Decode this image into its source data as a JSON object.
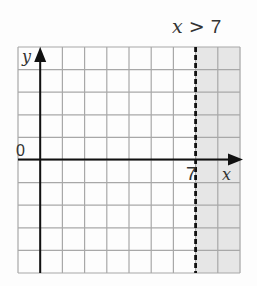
{
  "title": "x > 7",
  "axes": {
    "x_label": "x",
    "y_label": "y",
    "origin_label": "0",
    "tick_label": "7"
  },
  "grid": {
    "columns": 10,
    "rows": 10,
    "left": 18,
    "top": 47,
    "cell_w": 22.2,
    "cell_h": 22.6,
    "y_axis_col": 1,
    "x_axis_row": 5,
    "boundary_col": 8
  },
  "colors": {
    "grid": "#a8a8a8",
    "axis": "#111111",
    "shade": "#e6e6e6",
    "background": "#fdfdfd"
  },
  "inequality": {
    "variable": "x",
    "operator": ">",
    "value": 7,
    "boundary_style": "dashed",
    "shaded_region": "x > 7"
  }
}
